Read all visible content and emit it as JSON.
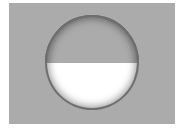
{
  "diagram": {
    "shape": "circle",
    "fill_fraction": 0.5,
    "fill_side": "bottom",
    "colors": {
      "background": "#ffffff",
      "panel": "#ababab",
      "circle_empty": "#ababab",
      "circle_fill": "#ffffff",
      "rim": "#6f6f6f"
    }
  }
}
